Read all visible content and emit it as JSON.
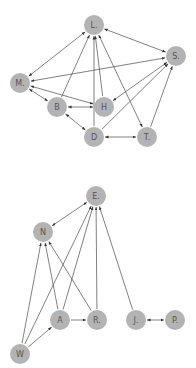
{
  "graphs": [
    {
      "name": "top-graph",
      "nodes": [
        {
          "id": "L",
          "label": "L."
        },
        {
          "id": "S",
          "label": "S."
        },
        {
          "id": "M",
          "label": "M."
        },
        {
          "id": "B",
          "label": "B"
        },
        {
          "id": "H",
          "label": "H"
        },
        {
          "id": "D",
          "label": "D"
        },
        {
          "id": "T",
          "label": "T."
        }
      ],
      "edges": [
        {
          "from": "L",
          "to": "M",
          "bidirectional": true
        },
        {
          "from": "L",
          "to": "S",
          "bidirectional": true
        },
        {
          "from": "L",
          "to": "T",
          "bidirectional": true
        },
        {
          "from": "B",
          "to": "L",
          "bidirectional": false
        },
        {
          "from": "D",
          "to": "L",
          "bidirectional": false
        },
        {
          "from": "H",
          "to": "L",
          "bidirectional": false
        },
        {
          "from": "M",
          "to": "S",
          "bidirectional": true
        },
        {
          "from": "M",
          "to": "H",
          "bidirectional": true
        },
        {
          "from": "M",
          "to": "B",
          "bidirectional": true
        },
        {
          "from": "B",
          "to": "H",
          "bidirectional": true
        },
        {
          "from": "B",
          "to": "D",
          "bidirectional": true
        },
        {
          "from": "D",
          "to": "S",
          "bidirectional": false
        },
        {
          "from": "H",
          "to": "S",
          "bidirectional": true
        },
        {
          "from": "T",
          "to": "S",
          "bidirectional": false
        },
        {
          "from": "D",
          "to": "T",
          "bidirectional": true
        }
      ]
    },
    {
      "name": "bottom-graph",
      "nodes": [
        {
          "id": "E",
          "label": "E."
        },
        {
          "id": "N",
          "label": "N"
        },
        {
          "id": "A",
          "label": "A"
        },
        {
          "id": "R",
          "label": "R."
        },
        {
          "id": "J",
          "label": "J."
        },
        {
          "id": "P",
          "label": "P."
        },
        {
          "id": "W",
          "label": "W"
        }
      ],
      "edges": [
        {
          "from": "N",
          "to": "E",
          "bidirectional": true
        },
        {
          "from": "W",
          "to": "N",
          "bidirectional": false
        },
        {
          "from": "W",
          "to": "E",
          "bidirectional": false
        },
        {
          "from": "W",
          "to": "A",
          "bidirectional": false
        },
        {
          "from": "A",
          "to": "N",
          "bidirectional": false
        },
        {
          "from": "A",
          "to": "E",
          "bidirectional": false
        },
        {
          "from": "A",
          "to": "R",
          "bidirectional": false
        },
        {
          "from": "R",
          "to": "N",
          "bidirectional": false
        },
        {
          "from": "R",
          "to": "E",
          "bidirectional": false
        },
        {
          "from": "J",
          "to": "E",
          "bidirectional": false
        },
        {
          "from": "J",
          "to": "P",
          "bidirectional": true
        }
      ]
    }
  ]
}
